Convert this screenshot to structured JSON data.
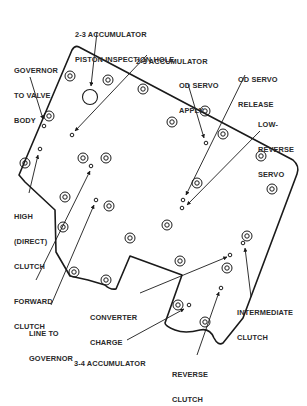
{
  "diagram": {
    "stroke_color": "#1a1a1a",
    "background": "#ffffff"
  },
  "labels": {
    "accum_inspection": [
      "2-3 ACCUMULATOR",
      "PISTON INSPECTION HOLE"
    ],
    "accum_23": [
      "2-3 ACCUMULATOR"
    ],
    "governor_to_valve_body": [
      "GOVERNOR",
      "TO VALVE",
      "BODY"
    ],
    "od_servo_apply": [
      "OD SERVO",
      "APPLY"
    ],
    "od_servo_release": [
      "OD SERVO",
      "RELEASE"
    ],
    "low_reverse_servo": [
      "LOW-",
      "REVERSE",
      "SERVO"
    ],
    "high_direct_clutch": [
      "HIGH",
      "(DIRECT)",
      "CLUTCH"
    ],
    "forward_clutch": [
      "FORWARD",
      "CLUTCH"
    ],
    "converter_charge": [
      "CONVERTER",
      "CHARGE"
    ],
    "intermediate_clutch": [
      "INTERMEDIATE",
      "CLUTCH"
    ],
    "line_to_governor": [
      "LINE TO",
      "GOVERNOR"
    ],
    "accum_34": [
      "3-4 ACCUMULATOR"
    ],
    "reverse_clutch": [
      "REVERSE",
      "CLUTCH"
    ]
  },
  "bolt_holes": [
    [
      70,
      76
    ],
    [
      108,
      80
    ],
    [
      143,
      89
    ],
    [
      49,
      116
    ],
    [
      83,
      105
    ],
    [
      37,
      170
    ],
    [
      66,
      198
    ],
    [
      106,
      200
    ],
    [
      63,
      227
    ],
    [
      106,
      211
    ],
    [
      130,
      270
    ],
    [
      112,
      245
    ],
    [
      172,
      291
    ],
    [
      113,
      258
    ],
    [
      225,
      127
    ],
    [
      172,
      122
    ],
    [
      204,
      111
    ],
    [
      264,
      155
    ],
    [
      274,
      196
    ],
    [
      196,
      209
    ],
    [
      163,
      223
    ],
    [
      247,
      235
    ],
    [
      243,
      233
    ],
    [
      234,
      264
    ],
    [
      206,
      283
    ],
    [
      248,
      257
    ],
    [
      168,
      257
    ],
    [
      138,
      248
    ],
    [
      178,
      304
    ],
    [
      197,
      183
    ]
  ],
  "ports": [
    [
      44,
      127
    ],
    [
      72,
      138
    ],
    [
      40,
      148
    ],
    [
      98,
      167
    ],
    [
      95,
      199
    ],
    [
      205,
      145
    ],
    [
      183,
      200
    ],
    [
      182,
      208
    ],
    [
      243,
      240
    ],
    [
      230,
      253
    ],
    [
      220,
      289
    ],
    [
      189,
      304
    ]
  ]
}
